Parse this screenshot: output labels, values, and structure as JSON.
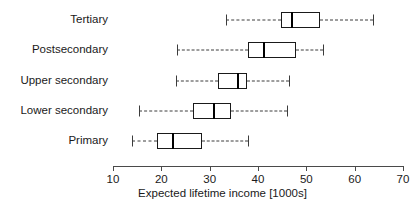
{
  "chart_data": {
    "type": "boxplot",
    "title": "",
    "xlabel": "Expected lifetime income [1000s]",
    "ylabel": "",
    "xlim": [
      10,
      70
    ],
    "xticks": [
      10,
      20,
      30,
      40,
      50,
      60,
      70
    ],
    "xtick_labels": [
      "10",
      "20",
      "30",
      "40",
      "50",
      "60",
      "70"
    ],
    "grid": false,
    "legend": null,
    "orientation": "horizontal",
    "categories": [
      "Tertiary",
      "Postsecondary",
      "Upper secondary",
      "Lower secondary",
      "Primary"
    ],
    "boxes": [
      {
        "category": "Tertiary",
        "whisker_low": 33.3,
        "q1": 44.8,
        "median": 46.9,
        "q3": 52.8,
        "whisker_high": 63.7
      },
      {
        "category": "Postsecondary",
        "whisker_low": 23.2,
        "q1": 37.9,
        "median": 41.1,
        "q3": 47.9,
        "whisker_high": 53.4
      },
      {
        "category": "Upper secondary",
        "whisker_low": 23.0,
        "q1": 31.8,
        "median": 35.7,
        "q3": 37.7,
        "whisker_high": 46.4
      },
      {
        "category": "Lower secondary",
        "whisker_low": 15.4,
        "q1": 26.5,
        "median": 30.6,
        "q3": 34.4,
        "whisker_high": 46.1
      },
      {
        "category": "Primary",
        "whisker_low": 13.9,
        "q1": 19.2,
        "median": 22.3,
        "q3": 28.5,
        "whisker_high": 38.0
      }
    ]
  },
  "style": {
    "box_stroke": "#1a1a1a",
    "median_stroke": "#000000",
    "whisker_stroke": "#3c3c3c",
    "axis_stroke": "#4a4a4a",
    "background": "#ffffff",
    "text_color": "#1a1a1a"
  },
  "geometry": {
    "x_left_px": 113,
    "x_right_px": 403,
    "x_min_value": 10,
    "x_max_value": 70,
    "row_centers_px": [
      20,
      50,
      81,
      111,
      141
    ]
  }
}
